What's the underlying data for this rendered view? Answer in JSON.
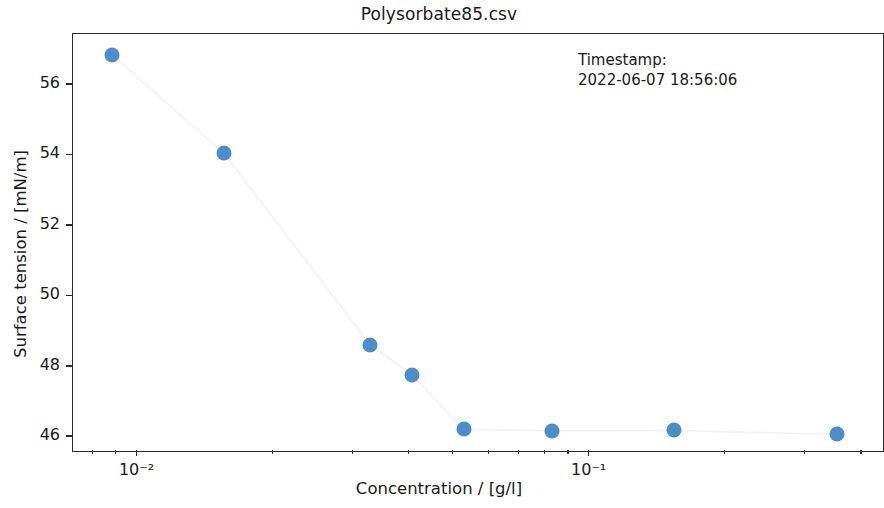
{
  "figure": {
    "title": "Polysorbate85.csv",
    "background": "#ffffff"
  },
  "annotation": {
    "line1": "Timestamp:",
    "line2": "2022-06-07 18:56:06"
  },
  "axes": {
    "xlabel": "Concentration / [g/l]",
    "ylabel": "Surface tension / [mN/m]",
    "x_tick_labels": [
      "10⁻²",
      "10⁻¹"
    ],
    "y_tick_labels": [
      "46",
      "48",
      "50",
      "52",
      "54",
      "56"
    ],
    "frame_color": "#2b2b2b"
  },
  "chart_data": {
    "type": "scatter",
    "title": "Polysorbate85.csv",
    "xlabel": "Concentration / [g/l]",
    "ylabel": "Surface tension / [mN/m]",
    "xscale": "log",
    "yscale": "linear",
    "xlim": [
      0.0072,
      0.45
    ],
    "ylim": [
      45.55,
      57.45
    ],
    "xticks": [
      0.01,
      0.1
    ],
    "xtick_labels": [
      "10⁻²",
      "10⁻¹"
    ],
    "yticks": [
      46,
      48,
      50,
      52,
      54,
      56
    ],
    "ytick_labels": [
      "46",
      "48",
      "50",
      "52",
      "54",
      "56"
    ],
    "grid": false,
    "legend": false,
    "marker_color": "#4c8dca",
    "line_color": "#f2f2f2",
    "series": [
      {
        "name": "Polysorbate85",
        "x": [
          0.0088,
          0.0155,
          0.0327,
          0.0405,
          0.0527,
          0.0825,
          0.154,
          0.352
        ],
        "y": [
          56.85,
          54.07,
          48.63,
          47.77,
          46.22,
          46.18,
          46.19,
          46.08
        ]
      }
    ],
    "annotations": [
      {
        "text": "Timestamp:\n2022-06-07 18:56:06",
        "x_px": 578,
        "y_px": 50
      }
    ]
  }
}
